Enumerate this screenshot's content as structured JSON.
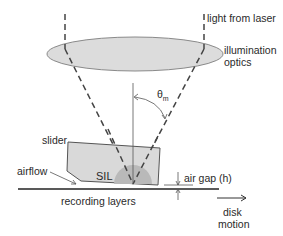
{
  "labels": {
    "light_from_laser": "light from laser",
    "illumination_line1": "illumination",
    "illumination_line2": "optics",
    "theta": "θ",
    "theta_sub": "m",
    "slider": "slider",
    "airflow": "airflow",
    "sil": "SIL",
    "air_gap": "air gap (h)",
    "recording_layers": "recording layers",
    "disk_line1": "disk",
    "disk_line2": "motion"
  },
  "colors": {
    "optics_fill": "#dcdcdc",
    "slider_fill": "#d9d9d9",
    "sil_fill": "#b9b9b9",
    "line": "#333333"
  }
}
